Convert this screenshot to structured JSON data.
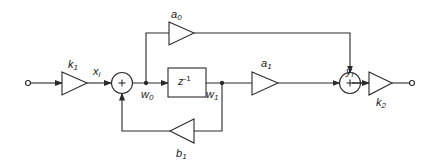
{
  "diagram": {
    "type": "signal-flow block diagram (first-order IIR section)",
    "colors": {
      "stroke": "#2a2a2a",
      "background": "#ffffff"
    },
    "nodes": [
      {
        "id": "input",
        "kind": "terminal"
      },
      {
        "id": "k1",
        "kind": "gain",
        "label": {
          "base": "k",
          "sub": "1"
        }
      },
      {
        "id": "sum1",
        "kind": "adder",
        "symbol": "+"
      },
      {
        "id": "delay",
        "kind": "delay",
        "label": {
          "base": "z",
          "sup": "-1"
        }
      },
      {
        "id": "a0",
        "kind": "gain",
        "label": {
          "base": "a",
          "sub": "0"
        }
      },
      {
        "id": "a1",
        "kind": "gain",
        "label": {
          "base": "a",
          "sub": "1"
        }
      },
      {
        "id": "b1",
        "kind": "gain",
        "label": {
          "base": "b",
          "sub": "1"
        }
      },
      {
        "id": "sum2",
        "kind": "adder",
        "symbol": "+"
      },
      {
        "id": "k2",
        "kind": "gain",
        "label": {
          "base": "k",
          "sub": "2"
        }
      },
      {
        "id": "output",
        "kind": "terminal"
      }
    ],
    "signals": {
      "xi": {
        "base": "x",
        "sub": "i"
      },
      "w0": {
        "base": "w",
        "sub": "0"
      },
      "w1": {
        "base": "w",
        "sub": "1"
      },
      "yi": {
        "base": "y",
        "sub": "i"
      }
    },
    "edges": [
      {
        "from": "input",
        "to": "k1"
      },
      {
        "from": "k1",
        "to": "sum1",
        "label": "xi"
      },
      {
        "from": "sum1",
        "to": "delay",
        "label": "w0"
      },
      {
        "from": "w0",
        "to": "a0"
      },
      {
        "from": "a0",
        "to": "sum2"
      },
      {
        "from": "delay",
        "to": "a1",
        "label": "w1"
      },
      {
        "from": "w1",
        "to": "b1"
      },
      {
        "from": "b1",
        "to": "sum1"
      },
      {
        "from": "a1",
        "to": "sum2"
      },
      {
        "from": "sum2",
        "to": "k2",
        "label": "yi"
      },
      {
        "from": "k2",
        "to": "output"
      }
    ]
  }
}
